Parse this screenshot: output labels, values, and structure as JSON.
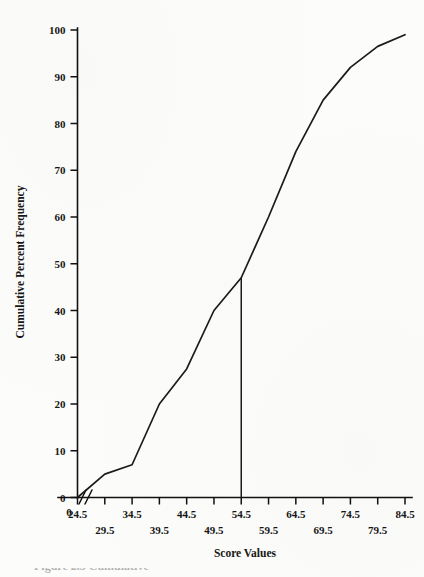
{
  "figure": {
    "caption_fragment": "Figure 2.5  Cumulative",
    "background_color": "#fcfcfa",
    "ink_color": "#1b1b1b"
  },
  "chart_data": {
    "type": "line",
    "title": "",
    "subtitle": "",
    "xlabel": "Score Values",
    "ylabel": "Cumulative Percent Frequency",
    "xlim": [
      24.5,
      84.5
    ],
    "ylim": [
      0,
      100
    ],
    "grid": false,
    "legend": "none",
    "axis_break": {
      "present": true,
      "symbol": "//",
      "between": [
        0,
        24.5
      ],
      "axis": "x"
    },
    "x_origin_label": "0",
    "x_ticks": [
      24.5,
      29.5,
      34.5,
      39.5,
      44.5,
      49.5,
      54.5,
      59.5,
      64.5,
      69.5,
      74.5,
      79.5,
      84.5
    ],
    "x_tick_labels": [
      "24.5",
      "29.5",
      "34.5",
      "39.5",
      "44.5",
      "49.5",
      "54.5",
      "59.5",
      "64.5",
      "69.5",
      "74.5",
      "79.5",
      "84.5"
    ],
    "x_tick_label_rows": [
      0,
      1,
      0,
      1,
      0,
      1,
      0,
      1,
      0,
      1,
      0,
      1,
      0
    ],
    "y_ticks": [
      0,
      10,
      20,
      30,
      40,
      50,
      60,
      70,
      80,
      90,
      100
    ],
    "y_tick_labels": [
      "0",
      "10",
      "20",
      "30",
      "40",
      "50",
      "60",
      "70",
      "80",
      "90",
      "100"
    ],
    "series": [
      {
        "name": "Cumulative percent frequency",
        "x": [
          24.5,
          29.5,
          34.5,
          39.5,
          44.5,
          49.5,
          54.5,
          59.5,
          64.5,
          69.5,
          74.5,
          79.5,
          84.5
        ],
        "values": [
          0,
          5,
          7,
          20,
          27.5,
          40,
          47,
          60,
          74,
          85,
          92,
          96.5,
          99
        ]
      }
    ],
    "annotations": [
      {
        "type": "vertical-reference-line",
        "name": "median-reference-line",
        "x": 54.5,
        "y_from": 0,
        "y_to": 47,
        "label": ""
      }
    ]
  },
  "axis_titles": {
    "x": "Score Values",
    "y": "Cumulative Percent Frequency"
  }
}
